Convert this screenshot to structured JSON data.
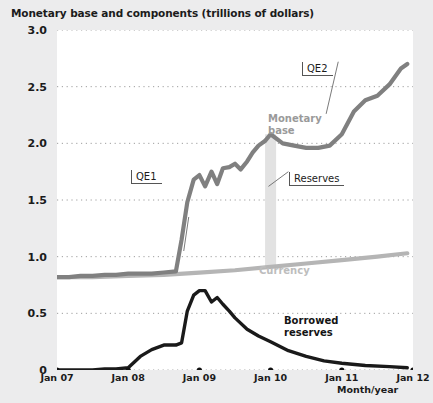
{
  "chart": {
    "title": "Monetary base and components (trillions of dollars)",
    "xlabel": "Month/year",
    "yticks": [
      "0",
      "0.5",
      "1.0",
      "1.5",
      "2.0",
      "2.5",
      "3.0"
    ],
    "xticks": [
      "Jan 07",
      "Jan 08",
      "Jan 09",
      "Jan 10",
      "Jan 11",
      "Jan 12"
    ],
    "labels": {
      "monetary_base": "Monetary\nbase",
      "monetary_base_line1": "Monetary",
      "monetary_base_line2": "base",
      "currency": "Currency",
      "borrowed_line1": "Borrowed",
      "borrowed_line2": "reserves",
      "qe1": "QE1",
      "qe2": "QE2",
      "reserves": "Reserves"
    },
    "colors": {
      "monetary_base": "#808080",
      "currency": "#b5b5b5",
      "borrowed_reserves": "#1a1a1a",
      "reserves_band": "#e2e2e2",
      "grid": "#9e9e9e",
      "plot_background": "#ffffff",
      "figure_background": "#ececed",
      "text": "#1b1b1b"
    }
  },
  "chart_data": {
    "type": "line",
    "title": "Monetary base and components (trillions of dollars)",
    "xlabel": "Month/year",
    "ylabel": "",
    "xlim": [
      2007.0,
      2012.0
    ],
    "ylim": [
      0,
      3.0
    ],
    "yticks": [
      0,
      0.5,
      1.0,
      1.5,
      2.0,
      2.5,
      3.0
    ],
    "xticks": [
      2007,
      2008,
      2009,
      2010,
      2011,
      2012
    ],
    "xtick_labels": [
      "Jan 07",
      "Jan 08",
      "Jan 09",
      "Jan 10",
      "Jan 11",
      "Jan 12"
    ],
    "grid": "horizontal-dotted",
    "legend": "inline-labels",
    "annotations": [
      {
        "text": "QE1",
        "x": 2008.85,
        "y": 1.35,
        "points_to_x": 2008.78,
        "points_to_y": 1.05
      },
      {
        "text": "QE2",
        "x": 2010.95,
        "y": 2.72,
        "points_to_x": 2010.78,
        "points_to_y": 2.26
      },
      {
        "text": "Reserves",
        "x": 2010.25,
        "y": 1.75,
        "points_to_x": 2009.97,
        "points_to_y": 1.62
      },
      {
        "text": "Monetary base",
        "x": 2010.05,
        "y": 2.08
      },
      {
        "text": "Currency",
        "x": 2009.9,
        "y": 0.88
      },
      {
        "text": "Borrowed reserves",
        "x": 2010.3,
        "y": 0.4
      }
    ],
    "series": [
      {
        "name": "Monetary base",
        "color": "#808080",
        "x": [
          2007.0,
          2007.17,
          2007.33,
          2007.5,
          2007.67,
          2007.83,
          2008.0,
          2008.17,
          2008.33,
          2008.5,
          2008.67,
          2008.75,
          2008.83,
          2008.92,
          2009.0,
          2009.08,
          2009.17,
          2009.25,
          2009.33,
          2009.42,
          2009.5,
          2009.58,
          2009.67,
          2009.75,
          2009.83,
          2009.92,
          2010.0,
          2010.17,
          2010.33,
          2010.5,
          2010.67,
          2010.83,
          2011.0,
          2011.17,
          2011.33,
          2011.5,
          2011.67,
          2011.83,
          2011.92
        ],
        "y": [
          0.82,
          0.82,
          0.83,
          0.83,
          0.84,
          0.84,
          0.85,
          0.85,
          0.85,
          0.86,
          0.87,
          1.15,
          1.48,
          1.68,
          1.72,
          1.62,
          1.75,
          1.64,
          1.78,
          1.79,
          1.82,
          1.77,
          1.84,
          1.92,
          1.98,
          2.02,
          2.08,
          2.0,
          1.98,
          1.96,
          1.96,
          1.98,
          2.08,
          2.28,
          2.38,
          2.42,
          2.52,
          2.66,
          2.7
        ]
      },
      {
        "name": "Currency",
        "color": "#b5b5b5",
        "x": [
          2007.0,
          2007.5,
          2008.0,
          2008.5,
          2009.0,
          2009.5,
          2010.0,
          2010.5,
          2011.0,
          2011.5,
          2011.92
        ],
        "y": [
          0.82,
          0.82,
          0.83,
          0.84,
          0.86,
          0.88,
          0.91,
          0.94,
          0.97,
          1.0,
          1.03
        ]
      },
      {
        "name": "Borrowed reserves",
        "color": "#1a1a1a",
        "x": [
          2007.0,
          2007.25,
          2007.5,
          2007.67,
          2007.83,
          2008.0,
          2008.17,
          2008.33,
          2008.5,
          2008.58,
          2008.67,
          2008.75,
          2008.83,
          2008.92,
          2009.0,
          2009.08,
          2009.17,
          2009.25,
          2009.33,
          2009.42,
          2009.5,
          2009.67,
          2009.83,
          2010.0,
          2010.25,
          2010.5,
          2010.75,
          2011.0,
          2011.33,
          2011.67,
          2011.92
        ],
        "y": [
          0.0,
          0.0,
          0.0,
          0.01,
          0.01,
          0.02,
          0.12,
          0.18,
          0.22,
          0.22,
          0.22,
          0.24,
          0.52,
          0.66,
          0.7,
          0.7,
          0.6,
          0.64,
          0.58,
          0.52,
          0.46,
          0.36,
          0.3,
          0.25,
          0.17,
          0.12,
          0.08,
          0.06,
          0.04,
          0.03,
          0.02
        ]
      }
    ],
    "reserves_band": {
      "x": 2010.0,
      "y_bottom": 0.91,
      "y_top": 2.08,
      "color": "#e2e2e2",
      "description": "Vertical shaded band at Jan 2010 showing reserves as the gap between the monetary base and currency"
    }
  }
}
